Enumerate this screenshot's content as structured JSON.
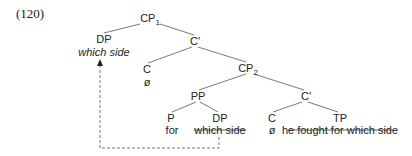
{
  "example_number": "(120)",
  "tree": {
    "root": {
      "label": "CP",
      "subscript": "1"
    },
    "spec_dp": {
      "label": "DP",
      "text": "which side"
    },
    "c_bar_1": {
      "label": "C'"
    },
    "c_head_1": {
      "label": "C",
      "text": "ø"
    },
    "cp2": {
      "label": "CP",
      "subscript": "2"
    },
    "pp": {
      "label": "PP"
    },
    "c_bar_2": {
      "label": "C'"
    },
    "p": {
      "label": "P",
      "text": "for"
    },
    "dp_trace": {
      "label": "DP",
      "text": "which side",
      "struck": true
    },
    "c_head_2": {
      "label": "C",
      "text": "ø"
    },
    "tp": {
      "label": "TP",
      "text": "he fought for which side",
      "struck": true
    }
  },
  "movement_arrow": {
    "from": "dp_trace",
    "to": "spec_dp",
    "style": "dashed"
  }
}
